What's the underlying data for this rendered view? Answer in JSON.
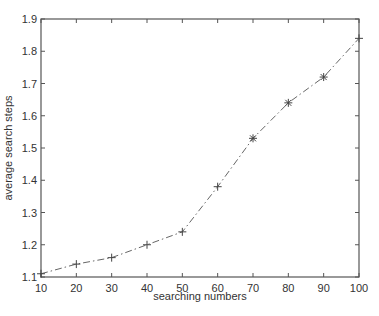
{
  "chart_data": {
    "type": "line",
    "title": "",
    "xlabel": "searching numbers",
    "ylabel": "average search steps",
    "x": [
      10,
      20,
      30,
      40,
      50,
      60,
      70,
      80,
      90,
      100
    ],
    "series": [
      {
        "name": "average search steps",
        "values": [
          1.11,
          1.14,
          1.16,
          1.2,
          1.24,
          1.38,
          1.53,
          1.64,
          1.72,
          1.84
        ],
        "line_style": "dash-dot",
        "markers": [
          "plus",
          "plus",
          "plus",
          "plus",
          "plus",
          "plus",
          "star",
          "star",
          "star",
          "plus"
        ],
        "color": "#555555"
      }
    ],
    "xlim": [
      10,
      100
    ],
    "ylim": [
      1.1,
      1.9
    ],
    "xticks": [
      10,
      20,
      30,
      40,
      50,
      60,
      70,
      80,
      90,
      100
    ],
    "xtick_labels": [
      "10",
      "20",
      "30",
      "40",
      "50",
      "60",
      "70",
      "80",
      "90",
      "100"
    ],
    "yticks": [
      1.1,
      1.2,
      1.3,
      1.4,
      1.5,
      1.6,
      1.7,
      1.8,
      1.9
    ],
    "ytick_labels": [
      "1.1",
      "1.2",
      "1.3",
      "1.4",
      "1.5",
      "1.6",
      "1.7",
      "1.8",
      "1.9"
    ],
    "grid": false,
    "legend": null
  },
  "colors": {
    "axis": "#555555",
    "line": "#666666",
    "text": "#333333"
  }
}
